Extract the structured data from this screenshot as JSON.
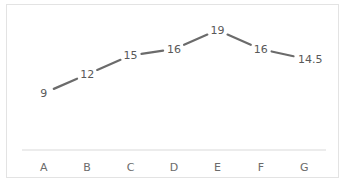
{
  "chart_data": {
    "type": "line",
    "title": "",
    "xlabel": "",
    "ylabel": "",
    "categories": [
      "A",
      "B",
      "C",
      "D",
      "E",
      "F",
      "G"
    ],
    "series": [
      {
        "name": "Series 1",
        "values": [
          9,
          12,
          15,
          16,
          19,
          16,
          14.5
        ],
        "color": "#6b6b6b"
      }
    ],
    "ylim": [
      0,
      23
    ],
    "grid": false,
    "legend": "none",
    "data_labels": [
      "9",
      "12",
      "15",
      "16",
      "19",
      "16",
      "14.5"
    ],
    "axis_color": "#d9d9d9",
    "label_color": "#595959"
  }
}
